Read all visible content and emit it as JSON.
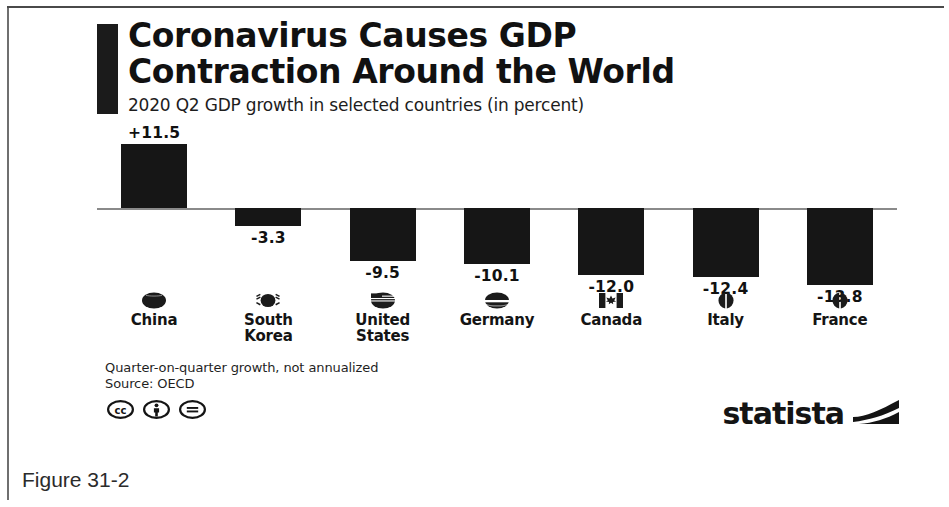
{
  "figure": {
    "caption": "Figure 31-2"
  },
  "header": {
    "title": "Coronavirus Causes GDP\nContraction Around the World",
    "subtitle": "2020 Q2 GDP growth in selected countries (in percent)"
  },
  "footer": {
    "note_line1": "Quarter-on-quarter growth, not annualized",
    "note_line2": "Source: OECD",
    "license_icons": [
      "cc-icon",
      "cc-by-icon",
      "cc-nd-icon"
    ],
    "brand": "statista",
    "brand_mark": "statista-swoosh-icon"
  },
  "colors": {
    "bar": "#161616",
    "accent": "#1b1b1b",
    "axis": "#8a8a8a",
    "text": "#111111"
  },
  "chart_data": {
    "type": "bar",
    "title": "Coronavirus Causes GDP Contraction Around the World",
    "subtitle": "2020 Q2 GDP growth in selected countries (in percent)",
    "xlabel": "",
    "ylabel": "GDP growth (percent)",
    "ylim": [
      -15,
      13
    ],
    "grid": false,
    "legend": false,
    "categories": [
      "China",
      "South Korea",
      "United States",
      "Germany",
      "Canada",
      "Italy",
      "France"
    ],
    "values": [
      11.5,
      -3.3,
      -9.5,
      -10.1,
      -12.0,
      -12.4,
      -13.8
    ],
    "data_labels": [
      "+11.5",
      "-3.3",
      "-9.5",
      "-10.1",
      "-12.0",
      "-12.4",
      "-13.8"
    ],
    "category_labels": [
      "China",
      "South\nKorea",
      "United\nStates",
      "Germany",
      "Canada",
      "Italy",
      "France"
    ],
    "flag_icons": [
      "flag-china-icon",
      "flag-south-korea-icon",
      "flag-united-states-icon",
      "flag-germany-icon",
      "flag-canada-icon",
      "flag-italy-icon",
      "flag-france-icon"
    ],
    "source": "OECD",
    "note": "Quarter-on-quarter growth, not annualized"
  }
}
